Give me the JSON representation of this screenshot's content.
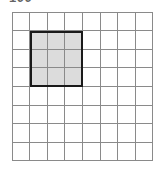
{
  "caption": {
    "text": "100"
  },
  "colors": {
    "background": "#ffffff",
    "grid_line": "#8a8a8a",
    "shade_fill": "#dcdcdc",
    "shade_border": "#1a1a1a",
    "caption_text": "#4a4a4a"
  },
  "chart_data": {
    "type": "heatmap",
    "title": "",
    "subtitle": "",
    "xlabel": "",
    "ylabel": "",
    "grid": {
      "columns": 8,
      "rows": 8,
      "total_cells": 64,
      "cell_width_px": 17.6,
      "cell_height_px": 18.6,
      "origin_px": [
        12,
        12
      ],
      "extent_px": [
        153,
        161
      ],
      "line_color": "#8a8a8a",
      "line_width_px": 1
    },
    "categories": [
      "1",
      "2",
      "3",
      "4",
      "5",
      "6",
      "7",
      "8"
    ],
    "row_labels": [
      "1",
      "2",
      "3",
      "4",
      "5",
      "6",
      "7",
      "8"
    ],
    "values": [
      [
        0,
        0,
        0,
        0,
        0,
        0,
        0,
        0
      ],
      [
        0,
        1,
        1,
        1,
        0,
        0,
        0,
        0
      ],
      [
        0,
        1,
        1,
        1,
        0,
        0,
        0,
        0
      ],
      [
        0,
        1,
        1,
        1,
        0,
        0,
        0,
        0
      ],
      [
        0,
        0,
        0,
        0,
        0,
        0,
        0,
        0
      ],
      [
        0,
        0,
        0,
        0,
        0,
        0,
        0,
        0
      ],
      [
        0,
        0,
        0,
        0,
        0,
        0,
        0,
        0
      ],
      [
        0,
        0,
        0,
        0,
        0,
        0,
        0,
        0
      ]
    ],
    "highlight_region": {
      "label": "shaded-square",
      "col_start": 2,
      "col_end": 4,
      "row_start": 2,
      "row_end": 4,
      "width_cells": 3,
      "height_cells": 3,
      "area_cells": 9,
      "fill": "#dcdcdc",
      "border_color": "#1a1a1a",
      "border_width_px": 2
    },
    "legend": [],
    "annotations": []
  }
}
